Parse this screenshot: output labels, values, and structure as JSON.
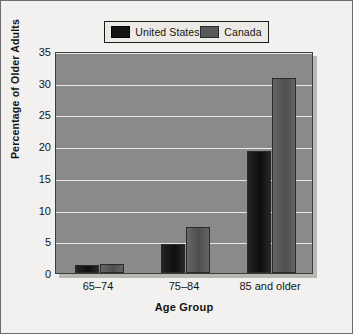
{
  "chart_data": {
    "type": "bar",
    "title": "",
    "subtitle": "",
    "xlabel": "Age Group",
    "ylabel": "Percentage of Older Adults",
    "categories": [
      "65–74",
      "75–84",
      "85 and older"
    ],
    "series": [
      {
        "name": "United States",
        "color": "#1a1a1a",
        "values": [
          1.2,
          4.5,
          19.2
        ]
      },
      {
        "name": "Canada",
        "color": "#5e5e5e",
        "values": [
          1.4,
          7.3,
          30.8
        ]
      }
    ],
    "ylim": [
      0,
      35
    ],
    "yticks": [
      0,
      5,
      10,
      15,
      20,
      25,
      30,
      35
    ],
    "ytick_labels": [
      "0",
      "5",
      "10",
      "15",
      "20",
      "25",
      "30",
      "35"
    ],
    "grid": true,
    "grid_axis": "y",
    "grid_color": "#e8e8e6",
    "legend_position": "top",
    "plot_background": "#8a8a8a",
    "figure_background": "#f2f1ef"
  },
  "legend": {
    "entries": [
      {
        "label": "United States"
      },
      {
        "label": "Canada"
      }
    ]
  }
}
